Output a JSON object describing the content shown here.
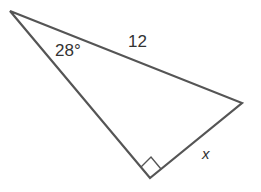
{
  "diagram": {
    "type": "right-triangle",
    "stroke_color": "#555555",
    "background": "#ffffff",
    "vertices": {
      "top_left": [
        10,
        11
      ],
      "right": [
        242,
        103
      ],
      "bottom_right_angle": [
        150,
        178
      ]
    },
    "labels": {
      "angle": "28°",
      "hypotenuse": "12",
      "unknown_side": "x"
    },
    "right_angle_marker": true
  }
}
